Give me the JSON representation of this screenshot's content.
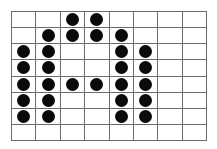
{
  "grid": {
    "rows": 8,
    "cols": 8,
    "line_color": "#6a6a6a",
    "dot_color": "#0a0a0a",
    "filled": [
      [
        0,
        0,
        1,
        1,
        0,
        0,
        0,
        0
      ],
      [
        0,
        1,
        1,
        1,
        1,
        0,
        0,
        0
      ],
      [
        1,
        1,
        0,
        0,
        1,
        1,
        0,
        0
      ],
      [
        1,
        1,
        0,
        0,
        1,
        1,
        0,
        0
      ],
      [
        1,
        1,
        1,
        1,
        1,
        1,
        0,
        0
      ],
      [
        1,
        1,
        0,
        0,
        1,
        1,
        0,
        0
      ],
      [
        1,
        1,
        0,
        0,
        1,
        1,
        0,
        0
      ],
      [
        0,
        0,
        0,
        0,
        0,
        0,
        0,
        0
      ]
    ]
  }
}
